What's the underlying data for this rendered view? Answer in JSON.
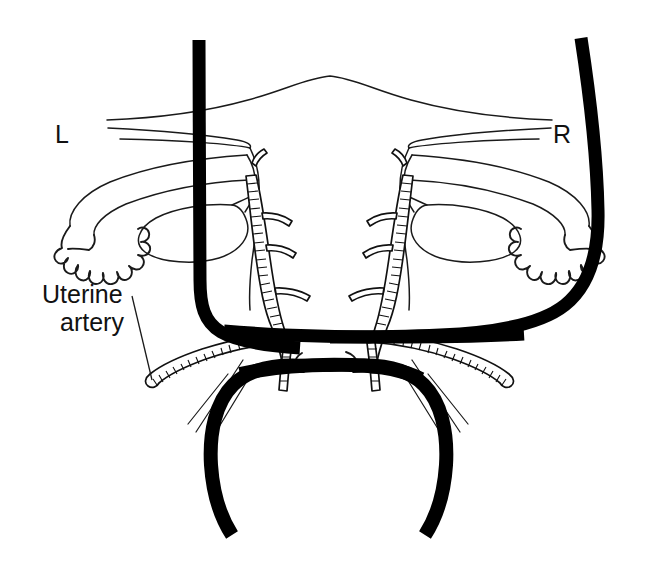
{
  "figure": {
    "name": "uterine-artery-diagram",
    "kind": "anatomical-line-drawing",
    "background_color": "#ffffff",
    "ink_color": "#111111",
    "width": 659,
    "height": 561
  },
  "labels": {
    "left_side": "L",
    "right_side": "R",
    "callout_line1": "Uterine",
    "callout_line2": "artery"
  },
  "structures": {
    "fundus": "uterine-fundus-outline",
    "broad_ligament": "broad-ligament-outline",
    "fallopian_tube_left": "left-fallopian-tube",
    "fallopian_tube_right": "right-fallopian-tube",
    "fimbriae_left": "left-fimbriae",
    "fimbriae_right": "right-fimbriae",
    "ovary_left": "left-ovary",
    "ovary_right": "right-ovary",
    "cervix": "cervix-outline",
    "ascending_artery_left": "left-ascending-uterine-artery",
    "ascending_artery_right": "right-ascending-uterine-artery",
    "artery_stump_left": "left-uterine-artery-stump",
    "artery_stump_right": "right-uterine-artery-stump",
    "clamp_band_left": "left-clamp-band",
    "clamp_band_right": "right-clamp-band",
    "clamp_band_upper": "upper-horizontal-clamp-band",
    "clamp_band_lower": "lower-horizontal-clamp-band",
    "vaginal_fibers": "vaginal-wall-fibers"
  }
}
